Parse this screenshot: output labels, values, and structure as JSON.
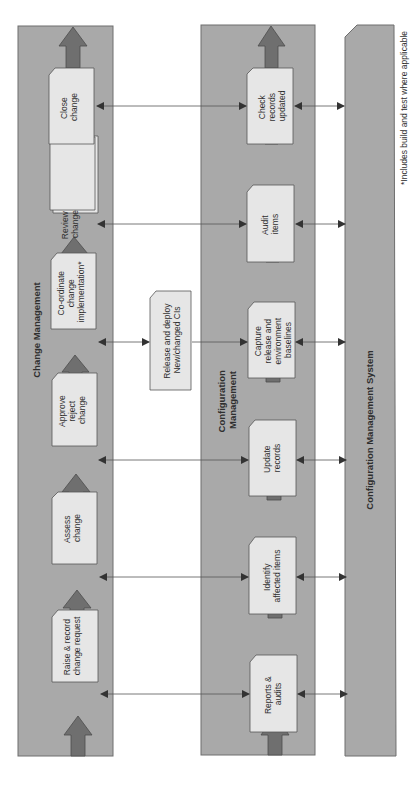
{
  "diagram": {
    "orientation": "rotated-90-ccw",
    "lanes": {
      "change_management": {
        "title": "Change Management",
        "steps": [
          {
            "line1": "Raise & record",
            "line2": "change request",
            "line3": ""
          },
          {
            "line1": "Assess",
            "line2": "change",
            "line3": ""
          },
          {
            "line1": "Approve",
            "line2": "reject",
            "line3": "change"
          },
          {
            "line1": "Co-ordinate",
            "line2": "change",
            "line3": "implementation*"
          },
          {
            "line1": "Review",
            "line2": "change",
            "line3": ""
          },
          {
            "line1": "Close",
            "line2": "change",
            "line3": ""
          }
        ]
      },
      "configuration_management": {
        "title_line1": "Configuration",
        "title_line2": "Management",
        "steps": [
          {
            "line1": "Reports &",
            "line2": "audits",
            "line3": "",
            "line4": ""
          },
          {
            "line1": "Identify",
            "line2": "affected items",
            "line3": "",
            "line4": ""
          },
          {
            "line1": "Update",
            "line2": "records",
            "line3": "",
            "line4": ""
          },
          {
            "line1": "Capture",
            "line2": "release and",
            "line3": "environment",
            "line4": "baselines"
          },
          {
            "line1": "Audit",
            "line2": "items",
            "line3": "",
            "line4": ""
          },
          {
            "line1": "Check",
            "line2": "records",
            "line3": "updated",
            "line4": ""
          }
        ]
      },
      "system": {
        "title": "Configuration Management System"
      }
    },
    "release_box": {
      "line1": "Release and deploy",
      "line2": "New/changed CIs"
    },
    "footnote": "*Includes build and test where applicable",
    "colors": {
      "lane_fill": "#a9a9a9",
      "lane_border": "#6e6e6e",
      "box_fill": "#e6e6e6",
      "arrow_fill": "#6f6f6f",
      "text": "#2f2f2f",
      "connector": "#555555"
    }
  }
}
